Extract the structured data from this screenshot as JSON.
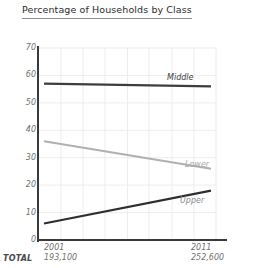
{
  "chart_data": {
    "type": "line",
    "title": "Percentage of Households by Class",
    "xlabel": "",
    "ylabel": "",
    "ylim": [
      0,
      70
    ],
    "yticks": [
      "0",
      "10",
      "20",
      "30",
      "40",
      "50",
      "60",
      "70"
    ],
    "ytick_values": [
      0,
      10,
      20,
      30,
      40,
      50,
      60,
      70
    ],
    "x": [
      "2001",
      "2011"
    ],
    "grid": true,
    "legend": "inline-labels",
    "series": [
      {
        "name": "Middle",
        "values": [
          57,
          56
        ],
        "color": "#3d3d3d"
      },
      {
        "name": "Lower",
        "values": [
          36,
          26
        ],
        "color": "#b0b0b0"
      },
      {
        "name": "Upper",
        "values": [
          6,
          18
        ],
        "color": "#2e2e2e"
      }
    ],
    "annotations": {
      "total_row_label": "TOTAL",
      "totals": [
        "193,100",
        "252,600"
      ]
    }
  },
  "axes": {
    "y_ticks": [
      {
        "label": "70",
        "value": 70
      },
      {
        "label": "60",
        "value": 60
      },
      {
        "label": "50",
        "value": 50
      },
      {
        "label": "40",
        "value": 40
      },
      {
        "label": "30",
        "value": 30
      },
      {
        "label": "20",
        "value": 20
      },
      {
        "label": "10",
        "value": 10
      },
      {
        "label": "0",
        "value": 0
      }
    ],
    "x_ticks": [
      {
        "year": "2001",
        "total": "193,100"
      },
      {
        "year": "2011",
        "total": "252,600"
      }
    ],
    "total_label": "TOTAL"
  },
  "series_labels": {
    "middle": "Middle",
    "lower": "Lower",
    "upper": "Upper"
  },
  "colors": {
    "middle": "#3d3d3d",
    "lower": "#b0b0b0",
    "upper": "#2e2e2e",
    "axis": "#3a3a3a",
    "grid": "#ededed",
    "tick_text": "#6f6f6f",
    "title_text": "#2b2b2b"
  }
}
